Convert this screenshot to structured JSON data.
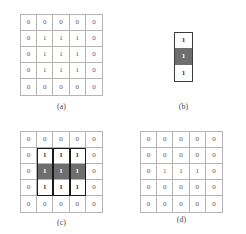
{
  "figure": {
    "colors": {
      "origin_shade": "#6e6e6e",
      "grid_line": "#b4b4b4",
      "se_border": "#3b3b3b",
      "overlay_border": "#1a1a1a",
      "digit": "#5a5a5a",
      "background": "#ffffff"
    }
  },
  "panels": [
    {
      "id": "a",
      "caption": "(a)",
      "role": "input-image",
      "rows": 5,
      "cols": 5,
      "values": [
        [
          "0",
          "0",
          "0",
          "0",
          "0"
        ],
        [
          "0",
          "1",
          "1",
          "1",
          "0"
        ],
        [
          "0",
          "1",
          "1",
          "1",
          "0"
        ],
        [
          "0",
          "1",
          "1",
          "1",
          "0"
        ],
        [
          "0",
          "0",
          "0",
          "0",
          "0"
        ]
      ]
    },
    {
      "id": "b",
      "caption": "(b)",
      "role": "structuring-element",
      "rows": 3,
      "cols": 1,
      "values": [
        [
          "1"
        ],
        [
          "1"
        ],
        [
          "1"
        ]
      ],
      "origin_index": 1
    },
    {
      "id": "c",
      "caption": "(c)",
      "role": "structuring-element-placements",
      "rows": 5,
      "cols": 5,
      "values": [
        [
          "0",
          "0",
          "0",
          "0",
          "0"
        ],
        [
          "0",
          "1",
          "1",
          "1",
          "0"
        ],
        [
          "0",
          "1",
          "1",
          "1",
          "0"
        ],
        [
          "0",
          "1",
          "1",
          "1",
          "0"
        ],
        [
          "0",
          "0",
          "0",
          "0",
          "0"
        ]
      ],
      "shaded_cells": [
        [
          2,
          1
        ],
        [
          2,
          2
        ],
        [
          2,
          3
        ]
      ],
      "bold_cells": [
        [
          1,
          1
        ],
        [
          1,
          2
        ],
        [
          1,
          3
        ],
        [
          3,
          1
        ],
        [
          3,
          2
        ],
        [
          3,
          3
        ]
      ],
      "overlay_boxes": [
        {
          "col": 1,
          "row_start": 1,
          "row_span": 3
        },
        {
          "col": 2,
          "row_start": 1,
          "row_span": 3
        },
        {
          "col": 3,
          "row_start": 1,
          "row_span": 3
        }
      ]
    },
    {
      "id": "d",
      "caption": "(d)",
      "role": "erosion-result",
      "rows": 5,
      "cols": 5,
      "values": [
        [
          "0",
          "0",
          "0",
          "0",
          "0"
        ],
        [
          "0",
          "0",
          "0",
          "0",
          "0"
        ],
        [
          "0",
          "1",
          "1",
          "1",
          "0"
        ],
        [
          "0",
          "0",
          "0",
          "0",
          "0"
        ],
        [
          "0",
          "0",
          "0",
          "0",
          "0"
        ]
      ]
    }
  ]
}
